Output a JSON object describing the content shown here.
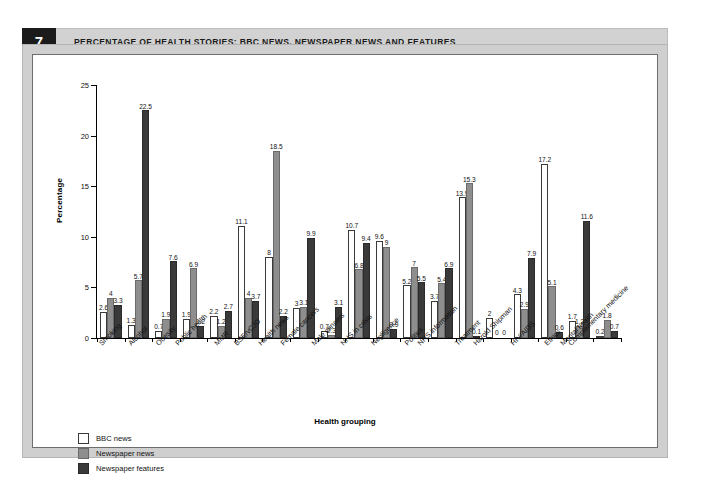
{
  "figure": {
    "number": "7",
    "title": "PERCENTAGE OF HEALTH STORIES: BBC NEWS, NEWSPAPER NEWS AND FEATURES"
  },
  "colors": {
    "bbc_news": "#ffffff",
    "newspaper_news": "#8e8e8e",
    "newspaper_features": "#3a3a3a",
    "frame": "#cfcfcf",
    "header_band": "#d2d2d2",
    "fignum_block": "#1b1b1b"
  },
  "legend": {
    "position": "below-axis-left",
    "entries": [
      {
        "label": "BBC news",
        "swatch": "b0"
      },
      {
        "label": "Newspaper news",
        "swatch": "b1"
      },
      {
        "label": "Newspaper features",
        "swatch": "b2"
      }
    ]
  },
  "chart_data": {
    "type": "bar",
    "title": "PERCENTAGE OF HEALTH STORIES: BBC NEWS, NEWSPAPER NEWS AND FEATURES",
    "xlabel": "Health grouping",
    "ylabel": "Percentage",
    "ylim": [
      0,
      25
    ],
    "yticks": [
      0,
      5,
      10,
      15,
      20,
      25
    ],
    "ytick_labels": [
      "0",
      "5",
      "10",
      "15",
      "20",
      "25"
    ],
    "grid": false,
    "legend_position": "bottom-left",
    "categories": [
      "Smoking",
      "Alcohol",
      "Obesity",
      "Public health",
      "MMR",
      "BSE/vCJD",
      "Health news",
      "Female cancers",
      "Male cancers",
      "NHS in crisis",
      "Negligence",
      "Politics",
      "NHS information",
      "Treatment",
      "Harold Shipman",
      "HIV/AIDS",
      "Ethics",
      "Mental health",
      "Complementary medicine"
    ],
    "series": [
      {
        "name": "BBC news",
        "color": "#ffffff",
        "values": [
          2.6,
          1.3,
          0.7,
          1.9,
          2.2,
          11.1,
          8,
          3,
          0.7,
          10.7,
          9.6,
          5.2,
          3.7,
          13.9,
          2,
          4.3,
          17.2,
          1.7,
          0.2
        ],
        "labels": [
          "2.6",
          "1.3",
          "0.7",
          "1.9",
          "2.2",
          "11.1",
          "8",
          "3",
          "0.7",
          "10.7",
          "9.6",
          "5.2",
          "3.7",
          "13.9",
          "2",
          "4.3",
          "17.2",
          "1.7",
          "0.2"
        ]
      },
      {
        "name": "Newspaper news",
        "color": "#8e8e8e",
        "values": [
          4,
          5.7,
          1.9,
          6.9,
          1.2,
          4,
          18.5,
          3.1,
          0.3,
          6.8,
          9,
          7,
          5.4,
          15.3,
          0,
          2.9,
          5.1,
          1.2,
          1.8
        ],
        "labels": [
          "4",
          "5.7",
          "1.9",
          "6.9",
          "1.2",
          "4",
          "18.5",
          "3.1",
          "0.3",
          "6.8",
          "9",
          "7",
          "5.4",
          "15.3",
          "0",
          "2.9",
          "5.1",
          "1.2",
          "1.8"
        ]
      },
      {
        "name": "Newspaper features",
        "color": "#3a3a3a",
        "values": [
          3.3,
          22.5,
          7.6,
          1.2,
          2.7,
          3.7,
          2.2,
          9.9,
          3.1,
          9.4,
          0.9,
          5.5,
          6.9,
          0.1,
          0,
          7.9,
          0.6,
          11.6,
          0.7
        ],
        "labels": [
          "3.3",
          "22.5",
          "7.6",
          "1.2",
          "2.7",
          "3.7",
          "2.2",
          "9.9",
          "3.1",
          "9.4",
          "0.9",
          "5.5",
          "6.9",
          "0.1",
          "0",
          "7.9",
          "0.6",
          "11.6",
          "0.7"
        ]
      }
    ]
  }
}
